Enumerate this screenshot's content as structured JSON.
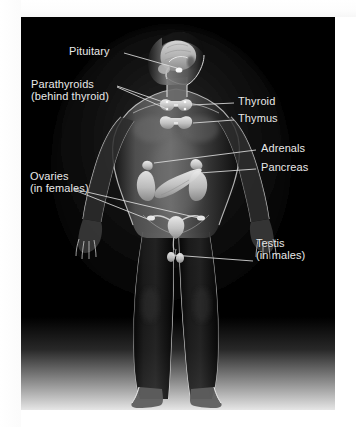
{
  "diagram": {
    "panel": {
      "background_color": "#000000",
      "page_background_color": "#ffffff",
      "label_color": "#e9e9e9",
      "leader_line_color": "#d8d8d8"
    },
    "labels": [
      {
        "id": "pituitary",
        "text": "Pituitary",
        "sub": ""
      },
      {
        "id": "parathyroids",
        "text": "Parathyroids",
        "sub": "(behind thyroid)"
      },
      {
        "id": "thyroid",
        "text": "Thyroid",
        "sub": ""
      },
      {
        "id": "thymus",
        "text": "Thymus",
        "sub": ""
      },
      {
        "id": "adrenals",
        "text": "Adrenals",
        "sub": ""
      },
      {
        "id": "pancreas",
        "text": "Pancreas",
        "sub": ""
      },
      {
        "id": "ovaries",
        "text": "Ovaries",
        "sub": "(in females)"
      },
      {
        "id": "testis",
        "text": "Testis",
        "sub": "(in males)"
      }
    ]
  }
}
